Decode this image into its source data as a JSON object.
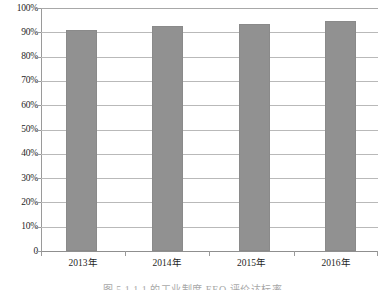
{
  "chart_data": {
    "type": "bar",
    "title": "",
    "subtitle": "",
    "xlabel": "",
    "ylabel": "",
    "categories": [
      "2013年",
      "2014年",
      "2015年",
      "2016年"
    ],
    "values": [
      91,
      92.5,
      93.5,
      94.5
    ],
    "series": [
      {
        "name": "",
        "values": [
          91,
          92.5,
          93.5,
          94.5
        ]
      }
    ],
    "ylim": [
      0,
      100
    ],
    "y_tick_values": [
      0,
      10,
      20,
      30,
      40,
      50,
      60,
      70,
      80,
      90,
      100
    ],
    "y_tick_labels": [
      "0",
      "10%",
      "20%",
      "30%",
      "40%",
      "50%",
      "60%",
      "70%",
      "80%",
      "90%",
      "100%"
    ],
    "grid": "horizontal",
    "legend": "none",
    "bar_color": "#919191",
    "gridline_color": "#b9b9b9",
    "axis_color": "#9a9a9a",
    "annotations": []
  },
  "caption": {
    "text": "图 5.1.1.1  的工业制度 EEO 评价达标率"
  }
}
